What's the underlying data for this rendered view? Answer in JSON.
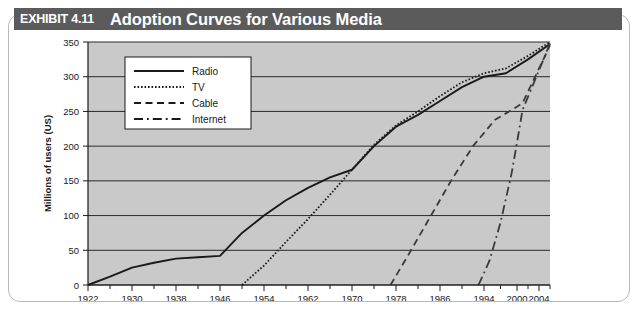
{
  "header": {
    "exhibit_tag": "EXHIBIT 4.11",
    "title": "Adoption Curves for Various Media",
    "band_color": "#5b5b5b",
    "text_color": "#ffffff"
  },
  "chart_data": {
    "type": "line",
    "title": "Adoption Curves for Various Media",
    "xlabel": "",
    "ylabel": "Millions of users (US)",
    "xlim": [
      1922,
      2006
    ],
    "ylim": [
      0,
      350
    ],
    "ytick_labels": [
      "0",
      "50",
      "100",
      "150",
      "200",
      "250",
      "300",
      "350"
    ],
    "yticks": [
      0,
      50,
      100,
      150,
      200,
      250,
      300,
      350
    ],
    "xtick_labels": [
      "1922",
      "1930",
      "1938",
      "1946",
      "1954",
      "1962",
      "1970",
      "1978",
      "1986",
      "1994",
      "2000",
      "2004"
    ],
    "xticks": [
      1922,
      1930,
      1938,
      1946,
      1954,
      1962,
      1970,
      1978,
      1986,
      1994,
      2000,
      2004
    ],
    "xticks_minor": [
      1926,
      1934,
      1942,
      1950,
      1958,
      1966,
      1974,
      1982,
      1990,
      1997,
      2002,
      2006
    ],
    "grid": true,
    "grid_axis": "y",
    "plot_background": "#c9c9c9",
    "legend_position": "top-left",
    "legend_background": "#ffffff",
    "series": [
      {
        "name": "Radio",
        "style": "solid",
        "color": "#1a1a1a",
        "points": [
          [
            1922,
            0
          ],
          [
            1926,
            12
          ],
          [
            1930,
            25
          ],
          [
            1934,
            32
          ],
          [
            1938,
            38
          ],
          [
            1942,
            40
          ],
          [
            1946,
            42
          ],
          [
            1950,
            75
          ],
          [
            1954,
            100
          ],
          [
            1958,
            122
          ],
          [
            1962,
            140
          ],
          [
            1966,
            155
          ],
          [
            1970,
            166
          ],
          [
            1974,
            200
          ],
          [
            1978,
            228
          ],
          [
            1982,
            245
          ],
          [
            1986,
            265
          ],
          [
            1990,
            285
          ],
          [
            1994,
            300
          ],
          [
            1998,
            305
          ],
          [
            2002,
            325
          ],
          [
            2006,
            347
          ]
        ]
      },
      {
        "name": "TV",
        "style": "dotted",
        "color": "#1a1a1a",
        "points": [
          [
            1950,
            0
          ],
          [
            1954,
            28
          ],
          [
            1958,
            62
          ],
          [
            1962,
            95
          ],
          [
            1966,
            130
          ],
          [
            1970,
            166
          ],
          [
            1974,
            202
          ],
          [
            1978,
            230
          ],
          [
            1982,
            250
          ],
          [
            1986,
            272
          ],
          [
            1990,
            292
          ],
          [
            1994,
            305
          ],
          [
            1998,
            312
          ],
          [
            2002,
            330
          ],
          [
            2006,
            350
          ]
        ]
      },
      {
        "name": "Cable",
        "style": "dashed",
        "color": "#3a3a3a",
        "points": [
          [
            1977,
            0
          ],
          [
            1980,
            40
          ],
          [
            1984,
            95
          ],
          [
            1988,
            150
          ],
          [
            1992,
            200
          ],
          [
            1996,
            238
          ],
          [
            1999,
            252
          ],
          [
            2001,
            262
          ],
          [
            2003,
            295
          ],
          [
            2006,
            345
          ]
        ]
      },
      {
        "name": "Internet",
        "style": "dashdot",
        "color": "#3a3a3a",
        "points": [
          [
            1993,
            0
          ],
          [
            1995,
            35
          ],
          [
            1997,
            90
          ],
          [
            1999,
            160
          ],
          [
            2000,
            205
          ],
          [
            2001,
            252
          ],
          [
            2003,
            290
          ],
          [
            2006,
            348
          ]
        ]
      }
    ],
    "legend": [
      {
        "label": "Radio",
        "style": "solid"
      },
      {
        "label": "TV",
        "style": "dotted"
      },
      {
        "label": "Cable",
        "style": "dashed"
      },
      {
        "label": "Internet",
        "style": "dashdot"
      }
    ]
  }
}
